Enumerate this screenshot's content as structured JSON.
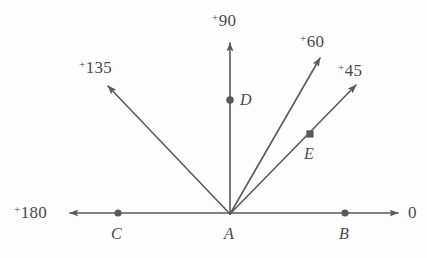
{
  "figure": {
    "name": "angle-ray-diagram",
    "background_color": "#fdfdfd",
    "stroke_color": "#5a5a5a",
    "text_color": "#4a4a4a",
    "vertex": {
      "id": "A",
      "x": 230,
      "y": 214
    }
  },
  "angle_labels": [
    {
      "id": "deg-180",
      "sup": "+",
      "value": "180",
      "x": 14,
      "y": 204
    },
    {
      "id": "deg-135",
      "sup": "+",
      "value": "135",
      "x": 79,
      "y": 59
    },
    {
      "id": "deg-90",
      "sup": "+",
      "value": "90",
      "x": 212,
      "y": 12
    },
    {
      "id": "deg-60",
      "sup": "+",
      "value": "60",
      "x": 300,
      "y": 33
    },
    {
      "id": "deg-45",
      "sup": "+",
      "value": "45",
      "x": 338,
      "y": 62
    },
    {
      "id": "deg-0",
      "sup": "",
      "value": "0",
      "x": 408,
      "y": 204
    }
  ],
  "point_labels": [
    {
      "id": "label-A",
      "text": "A",
      "x": 224,
      "y": 226
    },
    {
      "id": "label-B",
      "text": "B",
      "x": 339,
      "y": 226
    },
    {
      "id": "label-C",
      "text": "C",
      "x": 111,
      "y": 226
    },
    {
      "id": "label-D",
      "text": "D",
      "x": 240,
      "y": 92
    },
    {
      "id": "label-E",
      "text": "E",
      "x": 304,
      "y": 146
    }
  ],
  "rays": [
    {
      "id": "ray-180",
      "from_x": 230,
      "from_y": 213,
      "to_x": 70,
      "to_y": 213,
      "arrow": true
    },
    {
      "id": "ray-0",
      "from_x": 230,
      "from_y": 213,
      "to_x": 398,
      "to_y": 213,
      "arrow": true
    },
    {
      "id": "ray-135",
      "from_x": 230,
      "from_y": 214,
      "to_x": 108,
      "to_y": 86,
      "arrow": true
    },
    {
      "id": "ray-90",
      "from_x": 230,
      "from_y": 214,
      "to_x": 230,
      "to_y": 43,
      "arrow": true
    },
    {
      "id": "ray-60",
      "from_x": 230,
      "from_y": 214,
      "to_x": 320,
      "to_y": 58,
      "arrow": true
    },
    {
      "id": "ray-45",
      "from_x": 230,
      "from_y": 214,
      "to_x": 356,
      "to_y": 85,
      "arrow": true
    }
  ],
  "points": [
    {
      "id": "point-C",
      "x": 118,
      "y": 213,
      "shape": "circle",
      "r": 3.6
    },
    {
      "id": "point-B",
      "x": 345,
      "y": 213,
      "shape": "circle",
      "r": 3.6
    },
    {
      "id": "point-D",
      "x": 230,
      "y": 100,
      "shape": "circle",
      "r": 3.8
    },
    {
      "id": "point-E",
      "x": 310,
      "y": 134,
      "shape": "square",
      "r": 3.6
    }
  ]
}
